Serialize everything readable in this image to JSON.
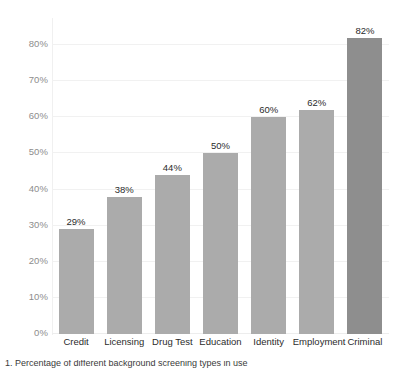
{
  "chart_data": {
    "type": "bar",
    "title": "",
    "subtitle": "",
    "xlabel": "",
    "ylabel": "",
    "categories": [
      "Credit",
      "Licensing",
      "Drug Test",
      "Education",
      "Identity",
      "Employment",
      "Criminal"
    ],
    "values": [
      29,
      38,
      44,
      50,
      60,
      62,
      82
    ],
    "value_labels": [
      "29%",
      "38%",
      "44%",
      "50%",
      "60%",
      "62%",
      "82%"
    ],
    "ylim": [
      0,
      80
    ],
    "y_ticks": [
      0,
      10,
      20,
      30,
      40,
      50,
      60,
      70,
      80
    ],
    "y_tick_labels": [
      "0%",
      "10%",
      "20%",
      "30%",
      "40%",
      "50%",
      "60%",
      "70%",
      "80%"
    ],
    "grid": true,
    "grid_axis": "y",
    "legend": false,
    "legend_position": "none",
    "series": [
      {
        "name": "Percent",
        "values": [
          29,
          38,
          44,
          50,
          60,
          62,
          82
        ]
      }
    ],
    "bar_colors": [
      "#ababab",
      "#ababab",
      "#ababab",
      "#ababab",
      "#ababab",
      "#ababab",
      "#8e8e8e"
    ],
    "colors": {
      "bar_fill": "#ababab",
      "bar_fill_accent": "#8e8e8e",
      "gridline": "#f1f1f1",
      "axis_line": "#f0f0f0",
      "tick_label": "#8d8d8d",
      "data_label": "#2b2b2b",
      "category_label": "#2b2b2b",
      "background": "#ffffff"
    }
  },
  "caption": {
    "text": "1. Percentage of different background screening types in use"
  }
}
